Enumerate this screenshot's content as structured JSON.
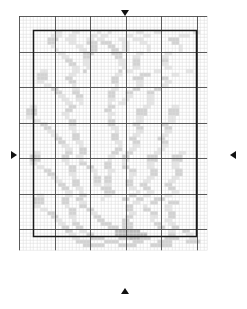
{
  "caption": {
    "text": ""
  },
  "colors": {
    "background": "#ffffff",
    "minor_grid": "#d8d8d8",
    "major_grid": "#4a4a4a",
    "border": "#1a1a1a",
    "marker": "#111111",
    "symbol_light": "#e3e3e3",
    "symbol_mid": "#cfcfcf",
    "symbol_dark": "#b3b3b3"
  },
  "chart_data": {
    "type": "heatmap",
    "title": "",
    "subtitle": "",
    "xlabel": "",
    "ylabel": "",
    "grid": true,
    "legend_position": "none",
    "cols": 53,
    "rows": 66,
    "cell_px": 3.55,
    "major_every": 10,
    "border_rect": {
      "x0": 4,
      "y0": 4,
      "x1": 50,
      "y1": 62
    },
    "center_markers": {
      "col": 28,
      "row": 33
    },
    "palette": {
      "0": "#ffffff",
      "1": "#e6e6e6",
      "2": "#d2d2d2",
      "3": "#bcbcbc"
    },
    "symbol_counts": {
      "light": 286,
      "mid": 171,
      "dark": 74
    },
    "motif": "six-point snowflake / star medallion",
    "rle_rows": [
      "53:0",
      "53:0",
      "53:0",
      "53:0",
      "10:0,2:1,3:0,2:1,5:0,1:1,2:0,1:1,7:0,2:1,3:0,2:1,9:0,2:1,2:0",
      "9:0,3:1,2:0,2:1,4:0,2:1,1:0,2:1,5:0,2:1,3:0,2:1,8:0,3:1,3:0",
      "8:0,3:2,2:0,3:1,3:0,2:1,1:0,2:1,4:0,2:1,2:0,3:1,7:0,3:2,3:0",
      "8:0,2:2,4:0,2:1,3:0,3:2,1:0,3:2,3:0,2:1,3:0,2:1,7:0,2:2,4:0",
      "9:0,1:1,6:0,2:1,2:0,2:2,3:0,2:2,2:0,2:1,5:0,1:1,8:0,1:1,5:0",
      "10:0,1:1,6:0,2:1,1:0,2:2,4:0,2:2,1:0,2:1,5:0,1:1,8:0,1:1,5:0",
      "11:0,2:1,5:0,3:2,5:0,3:2,4:0,2:1,6:0,2:1,4:0",
      "12:0,2:1,4:0,2:2,7:0,2:2,3:0,2:1,6:0,2:1,3:0",
      "13:0,2:2,3:0,2:1,8:0,2:1,2:0,2:2,6:0,2:2,2:0",
      "14:0,2:2,2:0,2:1,8:0,2:1,2:0,2:2,6:0,2:1,2:0",
      "15:0,2:1,2:0,1:1,9:0,1:1,2:0,2:1,7:0,2:1,1:0",
      "6:0,2:1,7:0,2:1,1:0,1:2,9:0,1:2,1:0,2:1,6:0,2:1,7:0,2:1,1:0",
      "5:0,3:2,6:0,2:1,11:0,2:1,5:0,3:2,6:0,2:1,1:0",
      "5:0,3:2,5:0,2:2,11:0,2:2,4:0,3:2,5:0,2:2,2:0",
      "5:0,2:1,7:0,2:2,10:0,2:2,5:0,2:1,6:0,2:1,3:0",
      "7:0,2:1,6:0,1:1,11:0,1:1,5:0,2:1,5:0,2:1,4:0",
      "9:0,2:2,4:0,2:1,9:0,2:1,4:0,2:2,4:0,2:2,4:0",
      "10:0,2:2,3:0,2:2,8:0,2:2,3:0,2:2,4:0,2:2,5:0",
      "11:0,2:1,3:0,2:2,7:0,2:2,3:0,2:1,4:0,2:1,6:0",
      "12:0,2:1,2:0,2:1,7:0,2:1,2:0,2:1,5:0,2:1,5:0",
      "13:0,2:1,2:0,1:1,7:0,1:1,2:0,2:1,6:0,2:1,4:0",
      "3:0,2:1,9:0,2:2,9:0,2:2,8:0,2:1,6:0,2:1,3:0",
      "2:0,3:2,8:0,2:2,9:0,2:2,7:0,3:2,6:0,3:2,2:0",
      "2:0,3:2,7:0,2:1,11:0,2:1,6:0,3:2,6:0,3:2,2:0",
      "2:0,2:1,9:0,1:1,11:0,1:1,7:0,2:1,7:0,2:1,3:0",
      "4:0,2:1,8:0,2:2,9:0,2:2,6:0,2:1,7:0,2:1,3:0",
      "6:0,2:2,6:0,2:2,9:0,2:2,5:0,2:2,6:0,2:2,4:0",
      "7:0,2:2,5:0,2:1,10:0,2:1,5:0,2:2,6:0,2:2,4:0",
      "8:0,2:1,5:0,1:1,11:0,1:1,5:0,2:1,6:0,2:1,5:0",
      "9:0,2:1,4:0,2:2,9:0,2:2,4:0,2:1,6:0,2:1,5:0",
      "10:0,2:2,3:0,2:2,9:0,2:2,3:0,2:2,6:0,2:2,5:0",
      "11:0,2:2,3:0,2:1,9:0,2:1,3:0,2:2,6:0,2:2,4:0",
      "12:0,2:1,3:0,1:1,10:0,1:1,3:0,2:1,6:0,2:1,4:0",
      "13:0,2:1,2:0,2:2,8:0,2:2,2:0,2:1,6:0,2:1,4:0",
      "4:0,2:1,7:0,2:2,2:0,2:2,7:0,2:2,2:0,2:2,6:0,2:1,5:0,2:1,3:0",
      "3:0,3:2,6:0,2:2,2:0,2:1,7:0,2:1,2:0,2:2,5:0,3:2,4:0,3:2,2:0",
      "3:0,3:2,6:0,2:1,3:0,1:1,7:0,1:1,3:0,2:1,5:0,3:2,4:0,3:2,2:0",
      "3:0,2:1,8:0,1:1,3:0,2:2,5:0,2:2,3:0,1:1,6:0,2:1,5:0,2:1,3:0",
      "5:0,2:1,7:0,2:2,3:0,2:2,3:0,2:2,3:0,2:2,5:0,2:1,5:0,2:1,3:0",
      "7:0,2:2,5:0,2:2,4:0,2:1,3:0,2:1,4:0,2:2,4:0,2:2,5:0,2:2,3:0",
      "8:0,2:2,4:0,2:1,5:0,1:1,3:0,1:1,5:0,2:1,4:0,2:2,5:0,2:2,3:0",
      "9:0,2:1,4:0,1:1,5:0,2:2,1:0,2:2,5:0,1:1,4:0,2:1,5:0,2:1,4:0",
      "10:0,2:1,3:0,2:2,4:0,2:2,1:0,2:2,4:0,2:2,3:0,2:1,5:0,2:1,4:0",
      "11:0,2:2,2:0,2:2,4:0,2:1,1:0,2:1,4:0,2:2,2:0,2:2,5:0,2:2,3:0",
      "12:0,2:2,2:0,2:1,5:0,3:2,5:0,2:1,2:0,2:2,5:0,2:2,3:0",
      "13:0,2:1,2:0,1:1,6:0,3:2,6:0,1:1,2:0,2:1,5:0,2:1,4:0",
      "5:0,2:1,6:0,2:1,2:0,2:2,5:0,2:1,5:0,2:2,2:0,2:1,4:0,2:1,4:0",
      "4:0,3:2,5:0,2:2,2:0,2:2,5:0,1:1,5:0,2:2,2:0,2:2,3:0,3:2,3:0",
      "4:0,3:2,5:0,2:2,3:0,2:1,13:0,2:1,3:0,2:2,3:0,3:2,3:0",
      "4:0,2:1,7:0,1:1,3:0,2:2,11:0,2:2,3:0,1:1,5:0,2:1,4:0",
      "6:0,2:1,6:0,2:2,3:0,2:2,9:0,2:2,3:0,2:2,4:0,2:1,5:0",
      "8:0,2:2,4:0,2:2,4:0,2:1,9:0,2:1,4:0,2:2,3:0,2:2,5:0",
      "9:0,2:2,3:0,2:1,5:0,2:2,7:0,2:2,5:0,2:1,3:0,2:2,4:0",
      "10:0,2:1,3:0,1:1,6:0,2:2,5:0,2:2,6:0,1:1,3:0,2:1,5:0",
      "11:0,2:1,2:0,2:2,6:0,3:2,3:0,3:2,6:0,2:2,2:0,2:1,5:0",
      "12:0,2:2,2:0,2:2,7:0,3:2,1:0,3:2,7:0,2:2,2:0,2:2,4:0",
      "13:0,2:2,2:0,2:1,8:0,7:3,8:0,2:1,2:0,2:2,4:0",
      "14:0,2:1,3:0,2:2,6:0,9:3,6:0,2:2,3:0,2:1,4:0",
      "15:0,2:1,3:0,4:2,4:0,3:2,3:3,3:2,4:0,4:2,3:0,2:1,4:0",
      "16:0,4:2,4:0,4:2,4:0,3:2,4:0,4:2,4:0,4:2,2:0",
      "18:0,6:2,4:0,5:2,4:0,6:2,6:0",
      "53:0"
    ]
  }
}
